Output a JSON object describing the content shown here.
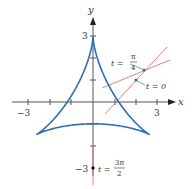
{
  "axes": {
    "x_label": "x",
    "y_label": "y",
    "x_tick_labels": [
      "−3",
      "3"
    ],
    "y_tick_labels": [
      "3",
      "−3"
    ]
  },
  "annotations": {
    "t_pi_over_4": {
      "lhs": "t =",
      "num": "π",
      "den": "4"
    },
    "t_zero": "t = 0",
    "t_3pi_over_2": {
      "lhs": "t =",
      "num": "3π",
      "den": "2"
    }
  },
  "colors": {
    "curve": "#2f6db5",
    "tangent": "#e07070",
    "axis": "#555555"
  }
}
